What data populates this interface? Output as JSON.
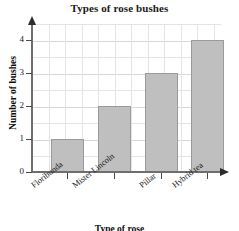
{
  "chart_data": {
    "type": "bar",
    "title": "Types of rose bushes",
    "xlabel": "Type of rose",
    "ylabel": "Number of bushes",
    "categories": [
      "Floribunda",
      "Mister Lincoln",
      "Pillar",
      "Hybrid tea"
    ],
    "values": [
      1,
      2,
      3,
      4
    ],
    "ylim": [
      0,
      4
    ],
    "ytick_labels": [
      "0",
      "1",
      "2",
      "3",
      "4"
    ],
    "ytick_values": [
      0,
      1,
      2,
      3,
      4
    ],
    "grid": true,
    "grid_minor_step": 0.5,
    "legend": null,
    "bar_color": "#bfbfbf",
    "bar_edge_color": "#9a9a9a",
    "grid_color": "#e3e3e8",
    "axis_color": "#6e6e6e",
    "text_color": "#1a1a1a"
  }
}
